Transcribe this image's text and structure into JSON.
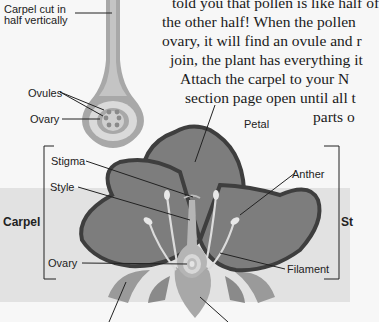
{
  "paragraph": {
    "lines": [
      "told you that pollen is like half of",
      "the other half! When the pollen",
      "ovary, it will find an ovule and r",
      "join, the plant has everything it",
      "Attach the carpel to your N",
      "section page open until all t",
      "parts o"
    ]
  },
  "cross_section": {
    "caption_line1": "Carpel cut in",
    "caption_line2": "half vertically",
    "ovules_label": "Ovules",
    "ovary_label": "Ovary"
  },
  "flower_diagram": {
    "petal_label": "Petal",
    "stigma_label": "Stigma",
    "style_label": "Style",
    "carpel_group_label": "Carpel",
    "ovary_label": "Ovary",
    "anther_label": "Anther",
    "filament_label": "Filament",
    "stamen_group_label_partial": "St"
  },
  "colors": {
    "background": "#f7f7f7",
    "band": "#e2e2e2",
    "petal_fill": "#7d7d7d",
    "petal_outline": "#3e3e3e",
    "sepal_fill": "#9a9a9a",
    "light_part": "#d9d9d9"
  }
}
